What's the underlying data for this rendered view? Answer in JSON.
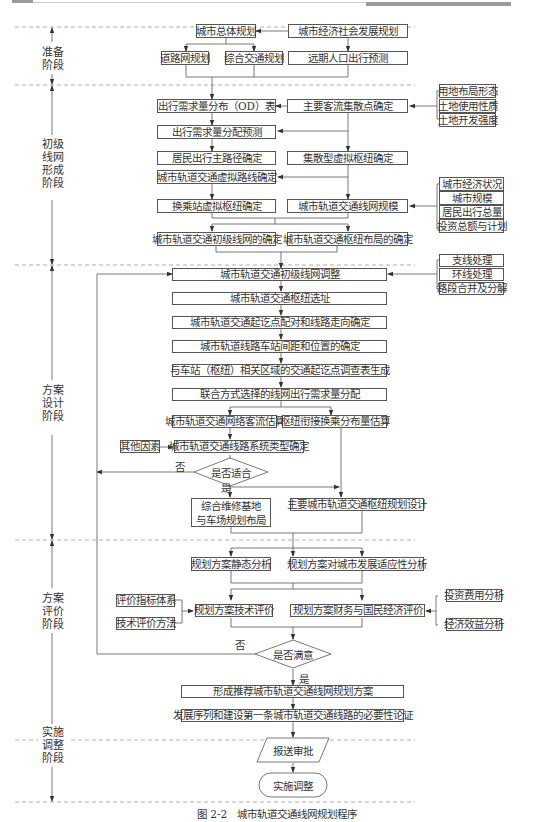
{
  "header": {
    "left_bar": "",
    "right_bar": ""
  },
  "stages": [
    {
      "id": "prep",
      "label": "准备\n阶段"
    },
    {
      "id": "initial",
      "label": "初级\n线网\n形成\n阶段"
    },
    {
      "id": "design",
      "label": "方案\n设计\n阶段"
    },
    {
      "id": "eval",
      "label": "方案\n评价\n阶段"
    },
    {
      "id": "impl",
      "label": "实施\n调整\n阶段"
    }
  ],
  "prep": {
    "city_master_plan": "城市总体规划",
    "econ_social_plan": "城市经济社会发展规划",
    "road_network_plan": "道路网规划",
    "integrated_transport_plan": "综合交通规划",
    "population_travel_forecast": "远期人口出行预测"
  },
  "initial": {
    "od_table": "出行需求量分布（OD）表",
    "main_passenger_points": "主要客流集散点确定",
    "demand_assignment": "出行需求量分配预测",
    "resident_main_paths": "居民出行主路径确定",
    "virtual_hub_collect": "集散型虚拟枢纽确定",
    "virtual_routes": "城市轨道交通虚拟路线确定",
    "transfer_virtual_hub": "换乘站虚拟枢纽确定",
    "network_scale": "城市轨道交通线网规模",
    "initial_network": "城市轨道交通初级线网的确定",
    "hub_layout": "城市轨道交通枢纽布局的确定",
    "land_inputs": [
      "用地布局形态",
      "土地使用性质",
      "土地开发强度"
    ],
    "scale_inputs": [
      "城市经济状况",
      "城市规模",
      "居民出行总量",
      "投资总额与计划"
    ]
  },
  "design": {
    "adjust": "城市轨道交通初级线网调整",
    "adjust_inputs": [
      "支线处理",
      "环线处理",
      "路段合并及分解"
    ],
    "hub_site": "城市轨道交通枢纽选址",
    "od_pairing": "城市轨道交通起讫点配对和线路走向确定",
    "station_spacing": "城市轨道线路车站间距和位置的确定",
    "od_survey": "与车站（枢纽）相关区域的交通起讫点调查表生成",
    "joint_mode_assign": "联合方式选择的线网出行需求量分配",
    "network_flow": "城市轨道交通网络客流估算",
    "hub_transfer": "枢纽衔接换乘分布量估算",
    "other_factors": "其他因素",
    "system_type": "城市轨道交通线路系统类型确定",
    "decision_suitable": "是否适合",
    "no": "否",
    "yes": "是",
    "depot_layout": [
      "综合维修基地",
      "与车场规划布局"
    ],
    "main_hub_design": "主要城市轨道交通枢纽规划设计"
  },
  "eval": {
    "static_analysis": "规划方案静态分析",
    "adaptability": "规划方案对城市发展适应性分析",
    "indicator_system": "评价指标体系",
    "tech_method": "技术评价方法",
    "tech_eval": "规划方案技术评价",
    "fin_eval": "规划方案财务与国民经济评价",
    "invest_cost": "投资费用分析",
    "econ_benefit": "经济效益分析",
    "decision_satisfied": "是否满意",
    "no": "否",
    "yes": "是"
  },
  "impl": {
    "recommended": "形成推荐城市轨道交通线网规划方案",
    "sequence": "发展序列和建设第一条城市轨道交通线路的必要性论证",
    "submit": "报送审批",
    "implement": "实施调整"
  },
  "caption": "图 2-2　城市轨道交通线网规划程序"
}
